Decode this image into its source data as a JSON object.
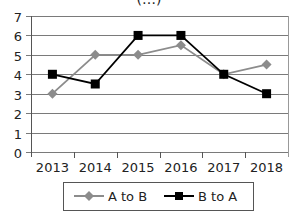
{
  "chart_data": {
    "type": "line",
    "title": "(…)",
    "categories": [
      "2013",
      "2014",
      "2015",
      "2016",
      "2017",
      "2018"
    ],
    "series": [
      {
        "name": "A to B",
        "color": "#8c8c8c",
        "marker": "diamond",
        "values": [
          3,
          5,
          5,
          5.5,
          4,
          4.5
        ]
      },
      {
        "name": "B to A",
        "color": "#000000",
        "marker": "square",
        "values": [
          4,
          3.5,
          6,
          6,
          4,
          3
        ]
      }
    ],
    "xlabel": "",
    "ylabel": "",
    "ylim": [
      0,
      7
    ],
    "yticks": [
      0,
      1,
      2,
      3,
      4,
      5,
      6,
      7
    ],
    "grid": true,
    "legend_position": "bottom"
  },
  "legend": {
    "items": [
      {
        "label": "A to B"
      },
      {
        "label": "B to A"
      }
    ]
  }
}
